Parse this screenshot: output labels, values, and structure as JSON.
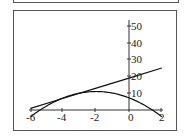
{
  "chart_data": {
    "type": "line",
    "title": "",
    "xlabel": "",
    "ylabel": "",
    "xlim": [
      -6,
      2
    ],
    "ylim": [
      -4,
      50
    ],
    "x_ticks": [
      "-6",
      "-4",
      "-2",
      "0",
      "2"
    ],
    "y_ticks": [
      "10",
      "20",
      "30",
      "40",
      "50"
    ],
    "grid": false,
    "legend": "none",
    "series": [
      {
        "name": "line",
        "formula": "y = 3x + 19",
        "x": [
          -6,
          -4,
          -2,
          0,
          2
        ],
        "values": [
          1,
          7,
          13,
          19,
          25
        ]
      },
      {
        "name": "parabola",
        "formula": "y = 11 - 0.9375(x+2)^2",
        "x": [
          -6,
          -5,
          -4,
          -3,
          -2,
          -1,
          0,
          1,
          2
        ],
        "values": [
          -4,
          2.6,
          7.25,
          10.1,
          11,
          10.1,
          7.25,
          2.6,
          -4
        ]
      }
    ]
  },
  "axes": {
    "x_labels": [
      "-6",
      "-4",
      "-2",
      "0",
      "2"
    ],
    "y_labels": [
      "10",
      "20",
      "30",
      "40",
      "50"
    ]
  }
}
